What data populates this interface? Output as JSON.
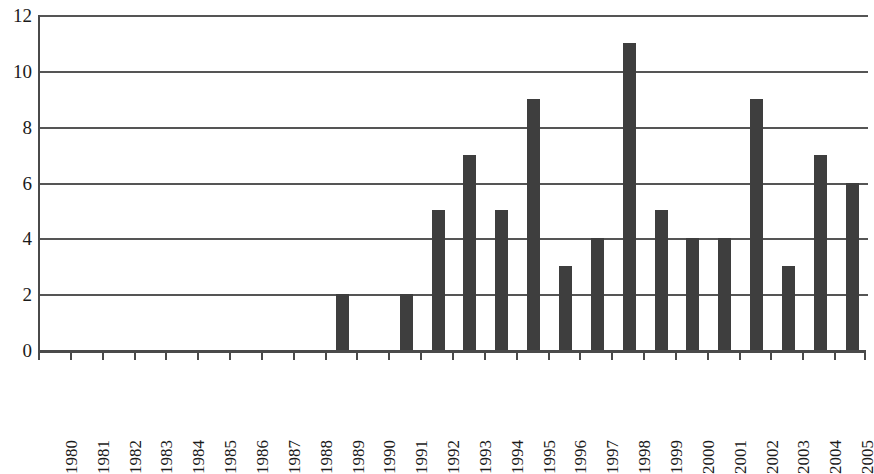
{
  "chart_data": {
    "type": "bar",
    "title": "",
    "subtitle": "",
    "xlabel": "",
    "ylabel": "",
    "categories": [
      "1980",
      "1981",
      "1982",
      "1983",
      "1984",
      "1985",
      "1986",
      "1987",
      "1988",
      "1989",
      "1990",
      "1991",
      "1992",
      "1993",
      "1994",
      "1995",
      "1996",
      "1997",
      "1998",
      "1999",
      "2000",
      "2001",
      "2002",
      "2003",
      "2004",
      "2005"
    ],
    "values": [
      0,
      0,
      0,
      0,
      0,
      0,
      0,
      0,
      0,
      2,
      0,
      2,
      5,
      7,
      5,
      9,
      3,
      4,
      11,
      5,
      4,
      4,
      9,
      3,
      7,
      6
    ],
    "ylim": [
      0,
      12
    ],
    "y_ticks": [
      0,
      2,
      4,
      6,
      8,
      10,
      12
    ],
    "y_tick_labels": [
      "0",
      "2",
      "4",
      "6",
      "8",
      "10",
      "12"
    ],
    "grid": true,
    "grid_axis": "y",
    "legend": null,
    "legend_position": "none",
    "annotations": [],
    "colors": {
      "bar": "#3e3e3e",
      "gridline": "#555555",
      "axis": "#4a4a4a",
      "text": "#1a1a1a",
      "background": "#ffffff"
    }
  }
}
